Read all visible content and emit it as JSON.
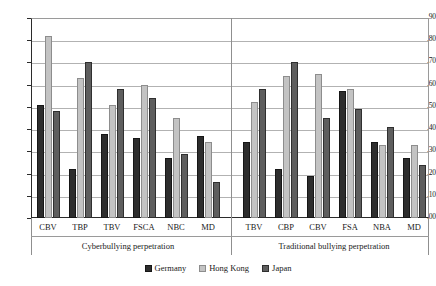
{
  "chart_data": {
    "type": "bar",
    "title": "",
    "xlabel": "",
    "ylabel": "",
    "ylim": [
      0.0,
      0.9
    ],
    "ytick_labels": [
      ".90",
      ".80",
      ".70",
      ".60",
      ".50",
      ".40",
      ".30",
      ".20",
      ".10",
      ".00"
    ],
    "ytick_values": [
      0.9,
      0.8,
      0.7,
      0.6,
      0.5,
      0.4,
      0.3,
      0.2,
      0.1,
      0.0
    ],
    "grid": true,
    "legend_position": "bottom",
    "categories": [
      "CBV",
      "TBP",
      "TBV",
      "FSCA",
      "NBC",
      "MD",
      "TBV",
      "CBP",
      "CBV",
      "FSA",
      "NBA",
      "MD"
    ],
    "series": [
      {
        "name": "Germany",
        "color": "#2d2d2d",
        "values": [
          0.51,
          0.22,
          0.38,
          0.36,
          0.27,
          0.37,
          0.34,
          0.22,
          0.19,
          0.57,
          0.34,
          0.27
        ]
      },
      {
        "name": "Hong Kong",
        "color": "#c3c3c3",
        "values": [
          0.82,
          0.63,
          0.51,
          0.6,
          0.45,
          0.34,
          0.52,
          0.64,
          0.65,
          0.58,
          0.33,
          0.33
        ]
      },
      {
        "name": "Japan",
        "color": "#5e5e5e",
        "values": [
          0.48,
          0.7,
          0.58,
          0.54,
          0.29,
          0.16,
          0.58,
          0.7,
          0.45,
          0.49,
          0.41,
          0.24
        ]
      }
    ],
    "sections": [
      {
        "label": "Cyberbullying perpetration",
        "categories": [
          "CBV",
          "TBP",
          "TBV",
          "FSCA",
          "NBC",
          "MD"
        ]
      },
      {
        "label": "Traditional bullying perpetration",
        "categories": [
          "TBV",
          "CBP",
          "CBV",
          "FSA",
          "NBA",
          "MD"
        ]
      }
    ]
  },
  "legend": {
    "items": [
      {
        "label": "Germany"
      },
      {
        "label": "Hong Kong"
      },
      {
        "label": "Japan"
      }
    ]
  }
}
